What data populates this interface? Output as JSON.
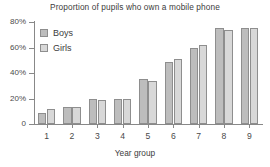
{
  "chart_data": {
    "type": "bar",
    "title": "Proportion of pupils who own a mobile phone",
    "xlabel": "Year group",
    "ylabel": "",
    "categories": [
      "1",
      "2",
      "3",
      "4",
      "5",
      "6",
      "7",
      "8",
      "9"
    ],
    "series": [
      {
        "name": "Boys",
        "color": "#bdbdbd",
        "values": [
          9,
          13,
          20,
          20,
          35,
          49,
          60,
          75,
          75
        ]
      },
      {
        "name": "Girls",
        "color": "#d8d8d8",
        "values": [
          12,
          13,
          19,
          20,
          34,
          51,
          62,
          74,
          75
        ]
      }
    ],
    "ylim": [
      0,
      80
    ],
    "yticks": [
      0,
      20,
      40,
      60,
      80
    ],
    "ytick_labels": [
      "0",
      "20%",
      "40%",
      "60%",
      "80%"
    ],
    "grid": false,
    "legend_position": "top-left"
  },
  "axis": {
    "line_color": "#888888"
  }
}
